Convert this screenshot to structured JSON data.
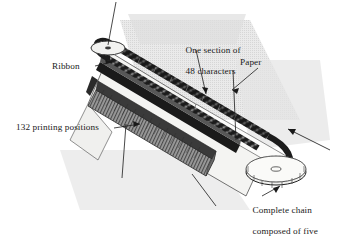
{
  "figure": {
    "background_color": "#ffffff",
    "ink_color": "#1a1a1a",
    "shadow_color": "#d8d8d8",
    "paper_color": "#f2f2f0",
    "chain_color": "#202020",
    "hammer_bank_color": "#8d8d8d"
  },
  "labels": {
    "ribbon": "Ribbon",
    "one_section_line1": "One section of",
    "one_section_line2": "48 characters",
    "paper": "Paper",
    "printing_positions": "132 printing positions",
    "complete_chain_line1": "Complete chain",
    "complete_chain_line2": "composed of five",
    "complete_chain_line3": "48-character selections"
  },
  "callouts": [
    {
      "name": "ribbon",
      "target": "ink-ribbon-strip"
    },
    {
      "name": "one-section-of-48-characters",
      "target": "chain-section"
    },
    {
      "name": "paper",
      "target": "paper-sheet"
    },
    {
      "name": "132-printing-positions",
      "target": "hammer-bank"
    },
    {
      "name": "complete-chain",
      "target": "sprocket-lower"
    }
  ],
  "parts": {
    "sprocket_upper": "drive-sprocket-upper",
    "sprocket_lower": "drive-sprocket-lower",
    "chain": "print-chain-loop",
    "hammer_bank": "hammer-bank-132-positions",
    "ribbon": "ink-ribbon",
    "paper": "paper-sheet",
    "direction_arrow": "chain-travel-direction"
  }
}
